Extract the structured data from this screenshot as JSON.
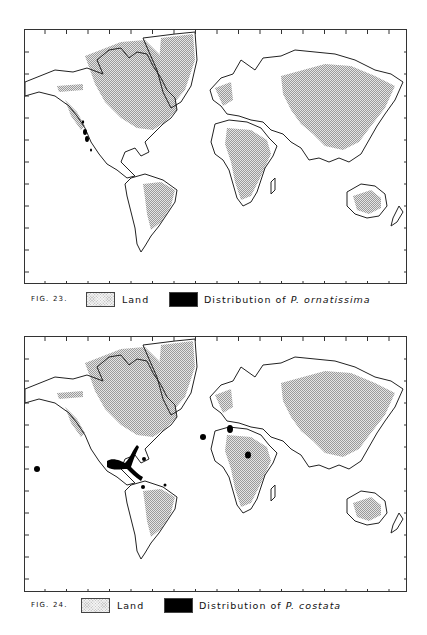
{
  "figures": [
    {
      "id": "fig23",
      "label": "FIG. 23.",
      "legend": {
        "land_label": "Land",
        "distribution_prefix": "Distribution of",
        "species": "P. ornatissima"
      },
      "distribution_regions": [
        "Pacific coast of North America (California)"
      ]
    },
    {
      "id": "fig24",
      "label": "FIG. 24.",
      "legend": {
        "land_label": "Land",
        "distribution_prefix": "Distribution of",
        "species": "P. costata"
      },
      "distribution_regions": [
        "Gulf of Mexico / Florida",
        "Caribbean",
        "Northern South America",
        "Hawaii",
        "Portugal",
        "Western Mediterranean",
        "Northern Red Sea"
      ]
    }
  ],
  "colors": {
    "land_fill": "#c8c8c8",
    "distribution_fill": "#000000",
    "coastline": "#222222"
  }
}
